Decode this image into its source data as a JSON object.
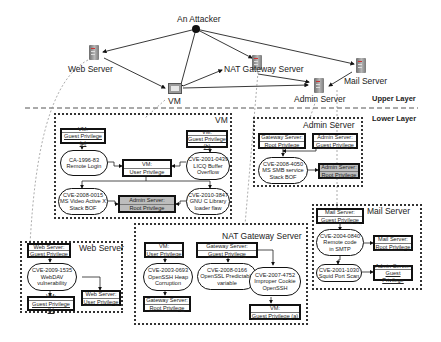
{
  "upper_layer": {
    "label": "Upper Layer",
    "nodes": {
      "attacker": "An Attacker",
      "web_server": "Web Server",
      "vm": "VM",
      "nat_gateway": "NAT Gateway Server",
      "admin_server": "Admin Server",
      "mail_server": "Mail Server"
    },
    "edges": [
      [
        "An Attacker",
        "Web Server"
      ],
      [
        "An Attacker",
        "VM"
      ],
      [
        "An Attacker",
        "NAT Gateway Server"
      ],
      [
        "An Attacker",
        "Mail Server"
      ],
      [
        "Web Server",
        "VM"
      ],
      [
        "VM",
        "NAT Gateway Server"
      ],
      [
        "VM",
        "Admin Server"
      ],
      [
        "NAT Gateway Server",
        "Admin Server"
      ],
      [
        "Mail Server",
        "Admin Server"
      ]
    ]
  },
  "lower_layer": {
    "label": "Lower Layer",
    "groups": {
      "vm": {
        "title": "VM",
        "nodes": {
          "guest_a": {
            "l1": "VM:",
            "l2": "Guest Privilege (a)"
          },
          "guest_b": {
            "l1": "VM:",
            "l2": "Guest Privilege (b)"
          },
          "ca_1996_83": {
            "l1": "CA-1996-83",
            "l2": "Remote Login"
          },
          "user_priv": {
            "l1": "VM:",
            "l2": "User Privilege"
          },
          "cve_2001_0439": {
            "l1": "CVE-2001-0439",
            "l2": "LICQ Buffer",
            "l3": "Overflow"
          },
          "cve_2008_0015": {
            "l1": "CVE-2008-0015",
            "l2": "MS Video Active X",
            "l3": "Stack BOF"
          },
          "admin_root": {
            "l1": "Admin Server:",
            "l2": "Root Privilege"
          },
          "cve_2010_3847": {
            "l1": "CVE-2010-3847",
            "l2": "GNU C Library",
            "l3": "loader flaw"
          }
        }
      },
      "admin": {
        "title": "Admin Server",
        "nodes": {
          "gw_root": {
            "l1": "Gateway Server:",
            "l2": "Root Privilege"
          },
          "admin_guest": {
            "l1": "Admin Server:",
            "l2": "Guest Privilege"
          },
          "cve_2008_4050": {
            "l1": "CVE-2008-4050",
            "l2": "MS SMB service",
            "l3": "Stack BOF"
          },
          "admin_root": {
            "l1": "Admin Server:",
            "l2": "Root Privilege"
          }
        }
      },
      "mail": {
        "title": "Mail Server",
        "nodes": {
          "mail_guest": {
            "l1": "Mail Server:",
            "l2": "Guest Privilege"
          },
          "cve_2004_0840": {
            "l1": "CVE-2004-0840",
            "l2": "Remote code",
            "l3": "in SMTP"
          },
          "mail_root": {
            "l1": "Mail Server:",
            "l2": "Root Privilege"
          },
          "cve_2001_1030": {
            "l1": "CVE-2001-1030",
            "l2": "Squid Port Scan"
          },
          "admin_guest": {
            "l1": "Admin Server:",
            "l2": "Guest Privilege"
          }
        }
      },
      "web": {
        "title": "Web Server",
        "nodes": {
          "web_guest": {
            "l1": "Web Server:",
            "l2": "Guest Privilege"
          },
          "cve_2009_1535": {
            "l1": "CVE-2009-1535",
            "l2": "WebDAV",
            "l3": "vulnerability"
          },
          "vm_guest_b": {
            "l1": "VM:",
            "l2": "Guest Privilege (b)"
          },
          "web_user": {
            "l1": "Web Server:",
            "l2": "User Privilege"
          }
        }
      },
      "nat": {
        "title": "NAT Gateway Server",
        "nodes": {
          "vm_user": {
            "l1": "VM:",
            "l2": "User Privilege"
          },
          "gw_guest": {
            "l1": "Gateway Server:",
            "l2": "Guest Privilege"
          },
          "cve_2003_0693": {
            "l1": "CVE-2003-0693",
            "l2": "OpenSSH Heap",
            "l3": "Corruption"
          },
          "cve_2008_0166": {
            "l1": "CVE-2008-0166",
            "l2": "OpenSSL Predictable",
            "l3": "variable"
          },
          "cve_2007_4752": {
            "l1": "CVE-2007-4752",
            "l2": "Improper Cookie",
            "l3": "OpenSSH"
          },
          "gw_root": {
            "l1": "Gateway Server:",
            "l2": "Root Privilege"
          },
          "vm_guest_a": {
            "l1": "VM:",
            "l2": "Guest Privilege (a)"
          }
        }
      }
    }
  }
}
